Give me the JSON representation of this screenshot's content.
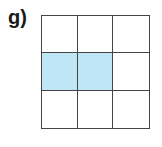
{
  "label": "g)",
  "grid": {
    "rows": 3,
    "cols": 3,
    "shaded_color": "#bfe6f5",
    "border_color": "#444444",
    "shaded_cells": [
      [
        2,
        1
      ],
      [
        2,
        2
      ]
    ],
    "shaded_fraction": "2/9"
  }
}
